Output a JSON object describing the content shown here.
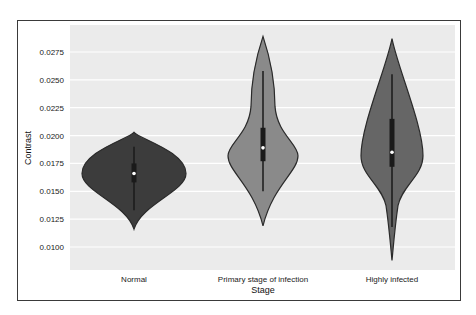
{
  "chart_data": {
    "type": "violin",
    "title": "",
    "xlabel": "Stage",
    "ylabel": "Contrast",
    "categories": [
      "Normal",
      "Primary stage of infection",
      "Highly infected"
    ],
    "ylim": [
      0.0085,
      0.0295
    ],
    "yticks": [
      0.01,
      0.0125,
      0.015,
      0.0175,
      0.02,
      0.0225,
      0.025,
      0.0275
    ],
    "ytick_labels": [
      "0.0100",
      "0.0125",
      "0.0150",
      "0.0175",
      "0.0200",
      "0.0225",
      "0.0250",
      "0.0275"
    ],
    "grid": true,
    "legend": null,
    "series": [
      {
        "name": "Normal",
        "color": "#3c3c3c",
        "min": 0.0116,
        "max": 0.0203,
        "median": 0.0166,
        "q1": 0.0158,
        "q3": 0.0175,
        "whisker_low": 0.0133,
        "whisker_high": 0.019,
        "widest_at": 0.0166
      },
      {
        "name": "Primary stage of infection",
        "color": "#8a8a8a",
        "min": 0.0119,
        "max": 0.0289,
        "median": 0.0189,
        "q1": 0.0177,
        "q3": 0.0207,
        "whisker_low": 0.015,
        "whisker_high": 0.0258,
        "widest_at": 0.0182
      },
      {
        "name": "Highly infected",
        "color": "#666666",
        "min": 0.0088,
        "max": 0.0287,
        "median": 0.0185,
        "q1": 0.0172,
        "q3": 0.0215,
        "whisker_low": 0.0118,
        "whisker_high": 0.0255,
        "widest_at": 0.0182
      }
    ]
  }
}
